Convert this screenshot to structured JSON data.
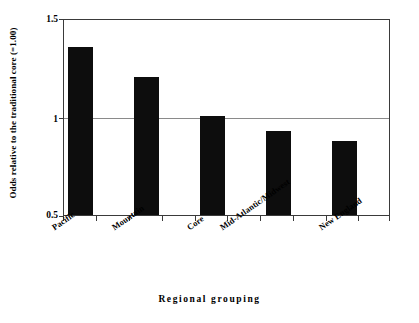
{
  "chart_data": {
    "type": "bar",
    "title": "",
    "subtitle": "",
    "xlabel": "Regional grouping",
    "ylabel": "Odds relative to the traditional core (=1.00)",
    "categories": [
      "Pacific",
      "Mountain",
      "Core",
      "Mid-Atlantic/Midwest",
      "New England"
    ],
    "values": [
      1.36,
      1.21,
      1.01,
      0.93,
      0.88
    ],
    "series": [
      {
        "name": "Odds relative to the traditional core",
        "values": [
          1.36,
          1.21,
          1.01,
          0.93,
          0.88
        ]
      }
    ],
    "ylim": [
      0.5,
      1.5
    ],
    "yticks": [
      0.5,
      1,
      1.5
    ],
    "ytick_labels": [
      "0.5",
      "1",
      "1.5"
    ],
    "reference_line": 1,
    "grid": "horizontal-at-reference",
    "legend": "none",
    "bar_color": "#0d0d0d",
    "axis_color": "#3a3a3a",
    "gridline_color": "#8a8a8a",
    "background_color": "#ffffff"
  },
  "axes": {
    "y_title": "Odds relative to the traditional core (=1.00)",
    "x_title": "Regional grouping",
    "y_ticks": [
      {
        "label": "1.5",
        "value": 1.5
      },
      {
        "label": "1",
        "value": 1
      },
      {
        "label": "0.5",
        "value": 0.5
      }
    ],
    "x_categories": [
      {
        "label": "Pacific",
        "value": 1.36
      },
      {
        "label": "Mountain",
        "value": 1.21
      },
      {
        "label": "Core",
        "value": 1.01
      },
      {
        "label": "Mid-Atlantic/Midwest",
        "value": 0.93
      },
      {
        "label": "New England",
        "value": 0.88
      }
    ]
  }
}
